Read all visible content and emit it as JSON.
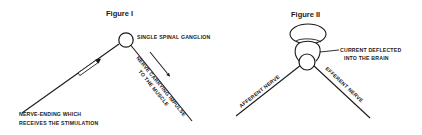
{
  "figure1": {
    "title": "Figure I",
    "ganglion_label": "SINGLE SPINAL GANGLION",
    "nerve_ending_label_line1": "NERVE-ENDING WHICH",
    "nerve_ending_label_line2": "RECEIVES THE STIMULATION",
    "efferent_label_line1": "NERVE CARRYING IMPULSE",
    "efferent_label_line2": "TO THE MUSCLE"
  },
  "figure2": {
    "title": "Figure II",
    "brain_label_line1": "CURRENT DEFLECTED",
    "brain_label_line2": "INTO THE BRAIN",
    "afferent_label": "AFFERENT NERVE",
    "efferent_label": "EFFERENT NERVE"
  },
  "colors": {
    "ink": "#1a1a1a",
    "paper": "#ffffff"
  }
}
